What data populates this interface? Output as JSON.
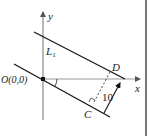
{
  "diagram": {
    "type": "coordinate-geometry",
    "labels": {
      "y_axis": "y",
      "x_axis": "x",
      "line_L1": "L",
      "line_L1_sub": "1",
      "origin": "O(0,0)",
      "point_D": "D",
      "point_C": "C",
      "distance": "10"
    },
    "colors": {
      "axis": "#9a9a9a",
      "line": "#1a1a1a",
      "text": "#222222",
      "border": "#1a1a1a"
    }
  }
}
